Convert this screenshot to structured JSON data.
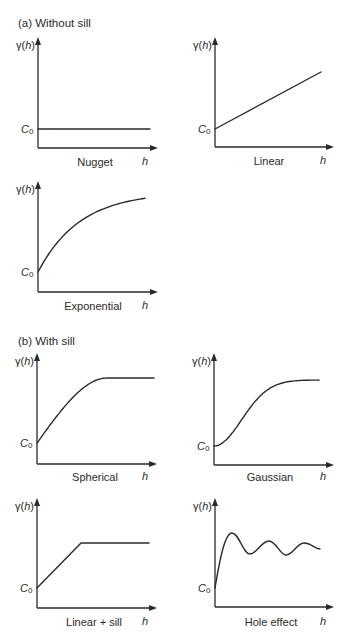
{
  "figure": {
    "sections": [
      {
        "id": "a",
        "title": "(a)  Without sill"
      },
      {
        "id": "b",
        "title": "(b)  With sill"
      }
    ],
    "y_axis_label": "γ(h)",
    "x_axis_label": "h",
    "nugget_label": "C",
    "nugget_subscript": "0",
    "panels": [
      {
        "section": "a",
        "name": "Nugget",
        "model": "nugget",
        "description": "constant line at C0"
      },
      {
        "section": "a",
        "name": "Linear",
        "model": "linear",
        "description": "straight line increasing from C0"
      },
      {
        "section": "a",
        "name": "Exponential",
        "model": "exponential",
        "description": "concave curve rising from C0 without reaching a plateau"
      },
      {
        "section": "b",
        "name": "Spherical",
        "model": "spherical",
        "description": "rapid rise from C0 to a plateau (sill)"
      },
      {
        "section": "b",
        "name": "Gaussian",
        "model": "gaussian",
        "description": "S-shaped rise from C0 to a plateau (sill)"
      },
      {
        "section": "b",
        "name": "Linear + sill",
        "model": "linear_sill",
        "description": "linear rise from C0 then flat sill"
      },
      {
        "section": "b",
        "name": "Hole effect",
        "model": "hole_effect",
        "description": "rise from C0 then damped oscillation around sill"
      }
    ]
  }
}
